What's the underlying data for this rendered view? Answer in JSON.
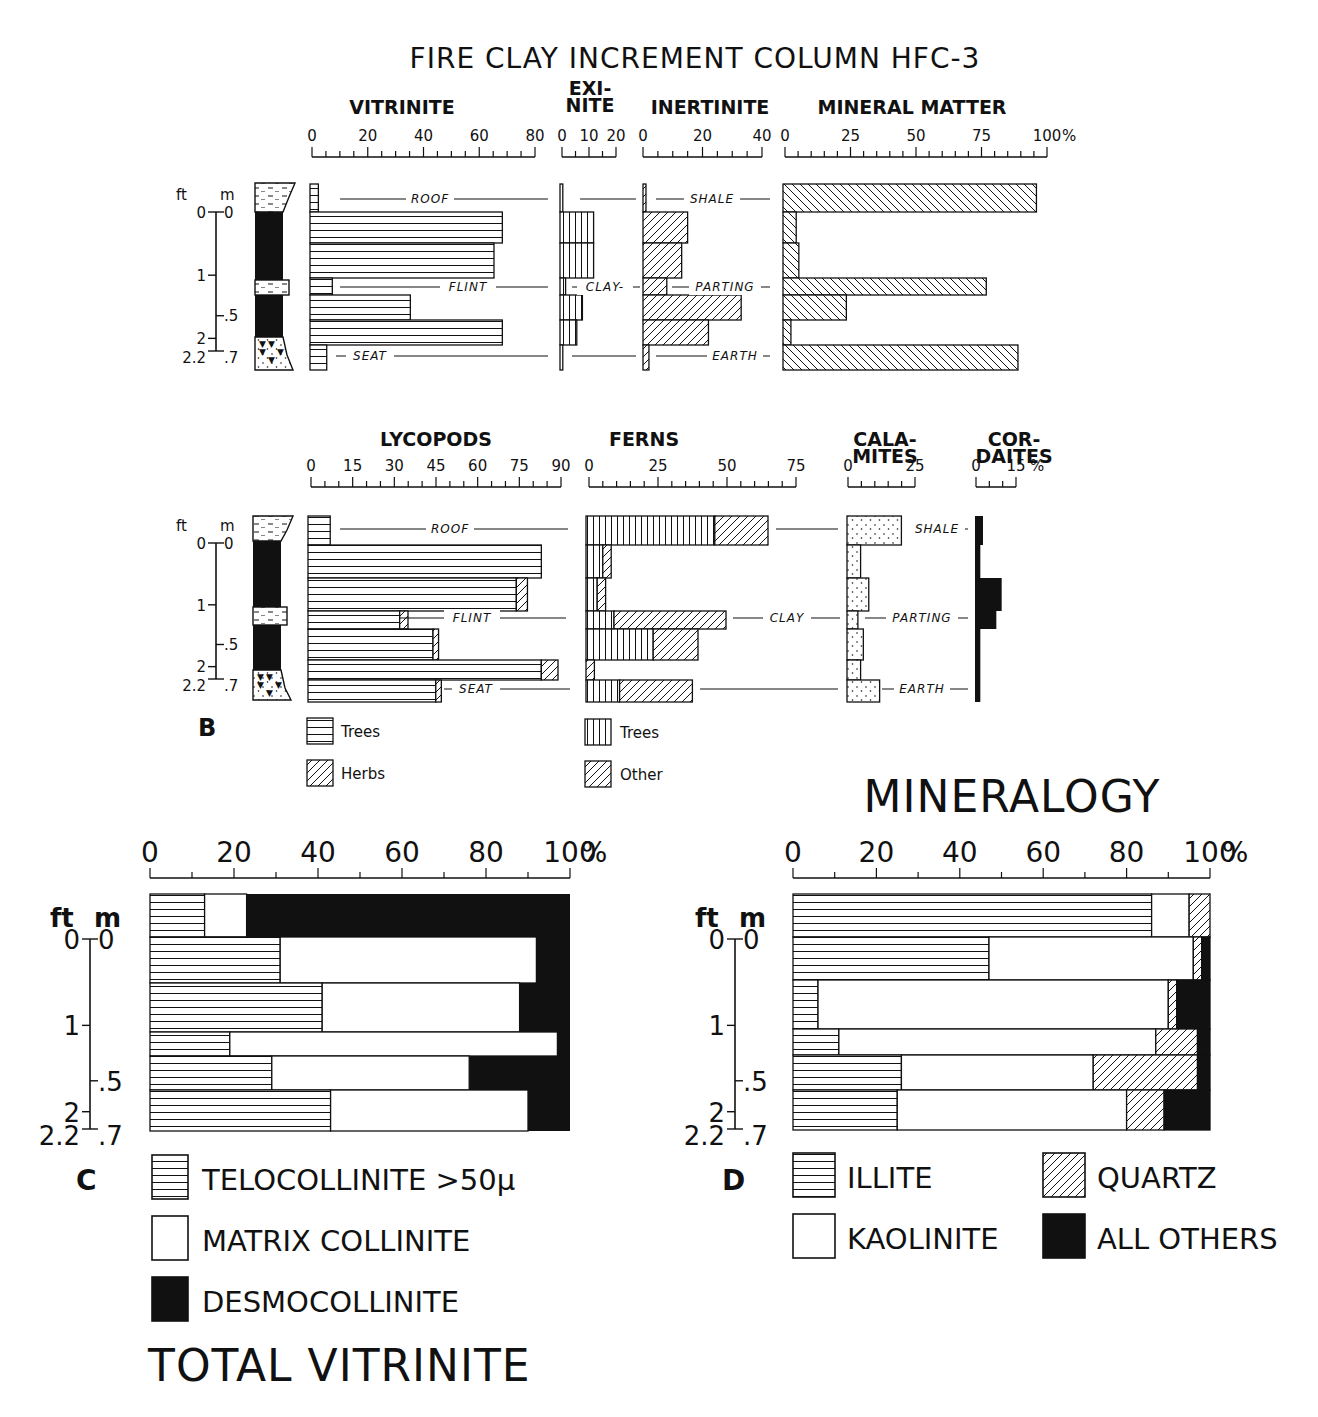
{
  "figure_title": "FIRE CLAY INCREMENT COLUMN HFC-3",
  "panel_labels": {
    "B": "B",
    "C": "C",
    "D": "D"
  },
  "depth_axis": {
    "ft_label": "ft",
    "m_label": "m",
    "ft_ticks": [
      "0",
      "1",
      "2",
      "2.2"
    ],
    "m_ticks": [
      "0",
      ".5",
      ".7"
    ]
  },
  "lithology_labels_top": {
    "left": [
      "ROOF",
      "FLINT",
      "SEAT"
    ],
    "mid": [
      "",
      "CLAY-",
      ""
    ],
    "right": [
      "SHALE",
      "PARTING",
      "EARTH"
    ]
  },
  "lithology_labels_bottom": {
    "left": [
      "ROOF",
      "FLINT",
      "SEAT"
    ],
    "mid": [
      "",
      "CLAY",
      ""
    ],
    "right": [
      "SHALE",
      "PARTING",
      "EARTH"
    ]
  },
  "legend_B": {
    "lycopods": [
      {
        "pattern": "horizontal",
        "label": "Trees"
      },
      {
        "pattern": "diagonal",
        "label": "Herbs"
      }
    ],
    "ferns": [
      {
        "pattern": "vertical",
        "label": "Trees"
      },
      {
        "pattern": "diagonal",
        "label": "Other"
      }
    ]
  },
  "legend_C": [
    {
      "pattern": "horizontal",
      "label": "TELOCOLLINITE >50μ"
    },
    {
      "pattern": "white",
      "label": "MATRIX COLLINITE"
    },
    {
      "pattern": "black",
      "label": "DESMOCOLLINITE"
    }
  ],
  "legend_D": [
    {
      "pattern": "horizontal",
      "label": "ILLITE"
    },
    {
      "pattern": "diagonal",
      "label": "QUARTZ"
    },
    {
      "pattern": "white",
      "label": "KAOLINITE"
    },
    {
      "pattern": "black",
      "label": "ALL OTHERS"
    }
  ],
  "chart_C_title": "TOTAL VITRINITE",
  "chart_D_title": "MINERALOGY",
  "chart_data": [
    {
      "type": "bar",
      "orientation": "horizontal",
      "panel": "A-top",
      "title": "VITRINITE",
      "ticks": [
        "0",
        "20",
        "40",
        "60",
        "80"
      ],
      "xlim": [
        0,
        80
      ],
      "categories": [
        "roof",
        "c1",
        "c2",
        "flint",
        "c3",
        "c4",
        "seat"
      ],
      "values": [
        3,
        69,
        66,
        8,
        36,
        69,
        6
      ]
    },
    {
      "type": "bar",
      "orientation": "horizontal",
      "panel": "A-top",
      "title": "EXI-NITE",
      "ticks": [
        "0",
        "10",
        "20"
      ],
      "xlim": [
        0,
        20
      ],
      "categories": [
        "roof",
        "c1",
        "c2",
        "flint",
        "c3",
        "c4",
        "seat"
      ],
      "values": [
        1,
        12,
        12,
        2,
        8,
        6,
        1
      ]
    },
    {
      "type": "bar",
      "orientation": "horizontal",
      "panel": "A-top",
      "title": "INERTINITE",
      "ticks": [
        "0",
        "20",
        "40"
      ],
      "xlim": [
        0,
        40
      ],
      "categories": [
        "roof",
        "c1",
        "c2",
        "flint",
        "c3",
        "c4",
        "seat"
      ],
      "values": [
        1,
        15,
        13,
        8,
        33,
        22,
        2
      ]
    },
    {
      "type": "bar",
      "orientation": "horizontal",
      "panel": "A-top",
      "title": "MINERAL MATTER",
      "ticks": [
        "0",
        "25",
        "50",
        "75",
        "100 %"
      ],
      "xlim": [
        0,
        100
      ],
      "categories": [
        "roof",
        "c1",
        "c2",
        "flint",
        "c3",
        "c4",
        "seat"
      ],
      "values": [
        96,
        5,
        6,
        77,
        24,
        3,
        89
      ]
    },
    {
      "type": "bar",
      "orientation": "horizontal",
      "stacked": true,
      "panel": "B",
      "title": "LYCOPODS",
      "ticks": [
        "0",
        "15",
        "30",
        "45",
        "60",
        "75",
        "90"
      ],
      "xlim": [
        0,
        90
      ],
      "categories": [
        "roof",
        "c1",
        "c2",
        "flint",
        "c3",
        "c4",
        "seat"
      ],
      "series": [
        {
          "name": "Trees",
          "values": [
            8,
            84,
            75,
            33,
            45,
            84,
            46
          ]
        },
        {
          "name": "Herbs",
          "values": [
            0,
            0,
            4,
            3,
            2,
            6,
            2
          ]
        }
      ]
    },
    {
      "type": "bar",
      "orientation": "horizontal",
      "stacked": true,
      "panel": "B",
      "title": "FERNS",
      "ticks": [
        "0",
        "25",
        "50",
        "75"
      ],
      "xlim": [
        0,
        75
      ],
      "categories": [
        "roof",
        "c1",
        "c2",
        "flint",
        "c3",
        "c4",
        "seat"
      ],
      "series": [
        {
          "name": "Trees",
          "values": [
            46,
            6,
            4,
            10,
            24,
            0,
            12
          ]
        },
        {
          "name": "Other",
          "values": [
            19,
            3,
            3,
            40,
            16,
            3,
            26
          ]
        }
      ]
    },
    {
      "type": "bar",
      "orientation": "horizontal",
      "panel": "B",
      "title": "CALA-MITES",
      "ticks": [
        "0",
        "25"
      ],
      "xlim": [
        0,
        25
      ],
      "categories": [
        "roof",
        "c1",
        "c2",
        "flint",
        "c3",
        "c4",
        "seat"
      ],
      "values": [
        20,
        5,
        8,
        4,
        6,
        5,
        12
      ]
    },
    {
      "type": "bar",
      "orientation": "horizontal",
      "panel": "B",
      "title": "COR-DAITES",
      "ticks": [
        "0",
        "15 %"
      ],
      "xlim": [
        0,
        15
      ],
      "categories": [
        "roof",
        "c1",
        "c2",
        "flint",
        "c3",
        "c4",
        "seat"
      ],
      "values": [
        3,
        2,
        10,
        8,
        2,
        2,
        2
      ]
    },
    {
      "type": "bar",
      "orientation": "horizontal",
      "stacked": true,
      "panel": "C",
      "title": "TOTAL VITRINITE",
      "ticks": [
        "0",
        "20",
        "40",
        "60",
        "80",
        "100%"
      ],
      "xlim": [
        0,
        100
      ],
      "categories": [
        "roof",
        "c1",
        "c2",
        "flint",
        "c3",
        "c4"
      ],
      "series": [
        {
          "name": "TELOCOLLINITE >50μ",
          "values": [
            13,
            31,
            41,
            19,
            29,
            43
          ]
        },
        {
          "name": "MATRIX COLLINITE",
          "values": [
            10,
            61,
            47,
            78,
            47,
            47
          ]
        },
        {
          "name": "DESMOCOLLINITE",
          "values": [
            77,
            8,
            12,
            3,
            24,
            10
          ]
        }
      ]
    },
    {
      "type": "bar",
      "orientation": "horizontal",
      "stacked": true,
      "panel": "D",
      "title": "MINERALOGY",
      "ticks": [
        "0",
        "20",
        "40",
        "60",
        "80",
        "100%"
      ],
      "xlim": [
        0,
        100
      ],
      "categories": [
        "roof",
        "c1",
        "c2",
        "flint",
        "c3",
        "c4"
      ],
      "series": [
        {
          "name": "ILLITE",
          "values": [
            86,
            47,
            6,
            11,
            26,
            25
          ]
        },
        {
          "name": "KAOLINITE",
          "values": [
            9,
            49,
            84,
            76,
            46,
            55
          ]
        },
        {
          "name": "QUARTZ",
          "values": [
            5,
            2,
            2,
            10,
            25,
            9
          ]
        },
        {
          "name": "ALL OTHERS",
          "values": [
            0,
            2,
            8,
            3,
            3,
            11
          ]
        }
      ]
    }
  ]
}
